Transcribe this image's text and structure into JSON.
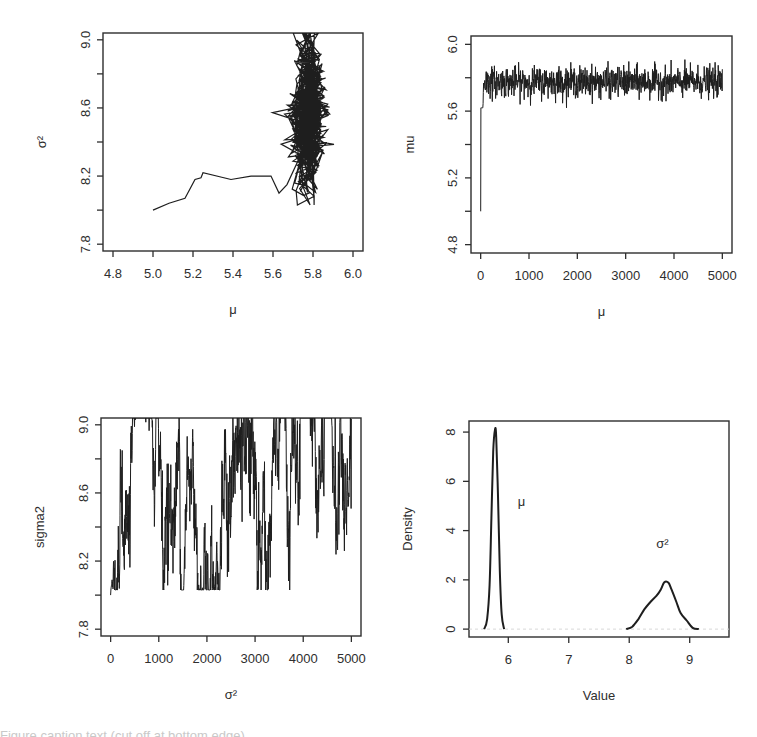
{
  "figure": {
    "width": 757,
    "height": 737,
    "line_color": "#1e1e1e",
    "axis_color": "#2e2e2e"
  },
  "chart_data": [
    {
      "id": "joint",
      "type": "line",
      "title": "",
      "xlabel": "μ",
      "ylabel": "σ²",
      "xlim": [
        4.75,
        6.05
      ],
      "ylim": [
        7.76,
        9.04
      ],
      "xticks": [
        4.8,
        5.0,
        5.2,
        5.4,
        5.6,
        5.8,
        6.0
      ],
      "xtick_labels": [
        "4.8",
        "5.0",
        "5.2",
        "5.4",
        "5.6",
        "5.8",
        "6.0"
      ],
      "yticks": [
        7.8,
        8.0,
        8.2,
        8.4,
        8.6,
        8.8,
        9.0
      ],
      "ytick_labels": [
        "7.8",
        "",
        "8.2",
        "",
        "8.6",
        "",
        "9.0"
      ],
      "burn_in_path": {
        "mu": [
          5.0,
          5.08,
          5.16,
          5.21,
          5.24,
          5.25,
          5.39,
          5.49,
          5.59,
          5.63,
          5.67
        ],
        "sigma2": [
          8.0,
          8.04,
          8.07,
          8.18,
          8.19,
          8.22,
          8.18,
          8.2,
          8.2,
          8.1,
          8.15
        ]
      },
      "cluster": {
        "mu_mean": 5.775,
        "mu_sd": 0.045,
        "sigma2_mean": 8.55,
        "sigma2_sd": 0.2,
        "n": 900
      },
      "box": {
        "x0": 103,
        "y0": 33,
        "x1": 363,
        "y1": 251
      }
    },
    {
      "id": "mu_trace",
      "type": "line",
      "title": "",
      "xlabel": "μ",
      "ylabel": "mu",
      "xlim": [
        -200,
        5200
      ],
      "ylim": [
        4.75,
        6.05
      ],
      "xticks": [
        0,
        1000,
        2000,
        3000,
        4000,
        5000
      ],
      "xtick_labels": [
        "0",
        "1000",
        "2000",
        "3000",
        "4000",
        "5000"
      ],
      "yticks": [
        4.8,
        5.0,
        5.2,
        5.4,
        5.6,
        5.8,
        6.0
      ],
      "ytick_labels": [
        "4.8",
        "",
        "5.2",
        "",
        "5.6",
        "",
        "6.0"
      ],
      "series": [
        {
          "name": "mu",
          "start": 5.0,
          "mean": 5.775,
          "sd": 0.045,
          "min": 5.62,
          "max": 5.92,
          "iterations": 5000
        }
      ],
      "box": {
        "x0": 471,
        "y0": 36,
        "x1": 732,
        "y1": 253
      }
    },
    {
      "id": "sigma2_trace",
      "type": "line",
      "title": "",
      "xlabel": "σ²",
      "ylabel": "sigma2",
      "xlim": [
        -200,
        5200
      ],
      "ylim": [
        7.76,
        9.04
      ],
      "xticks": [
        0,
        1000,
        2000,
        3000,
        4000,
        5000
      ],
      "xtick_labels": [
        "0",
        "1000",
        "2000",
        "3000",
        "4000",
        "5000"
      ],
      "yticks": [
        7.8,
        8.0,
        8.2,
        8.4,
        8.6,
        8.8,
        9.0
      ],
      "ytick_labels": [
        "7.8",
        "",
        "8.2",
        "",
        "8.6",
        "",
        "9.0"
      ],
      "series": [
        {
          "name": "sigma2",
          "start": 8.0,
          "mean": 8.55,
          "sd": 0.2,
          "min": 8.03,
          "max": 9.04,
          "iterations": 5000
        }
      ],
      "box": {
        "x0": 101,
        "y0": 418,
        "x1": 361,
        "y1": 636
      }
    },
    {
      "id": "density",
      "type": "line",
      "title": "",
      "xlabel": "Value",
      "ylabel": "Density",
      "xlim": [
        5.35,
        9.65
      ],
      "ylim": [
        -0.32,
        8.45
      ],
      "xticks": [
        6,
        7,
        8,
        9
      ],
      "xtick_labels": [
        "6",
        "7",
        "8",
        "9"
      ],
      "yticks": [
        0,
        2,
        4,
        6,
        8
      ],
      "ytick_labels": [
        "0",
        "2",
        "4",
        "6",
        "8"
      ],
      "series": [
        {
          "name": "μ",
          "x": [
            5.6,
            5.65,
            5.69,
            5.72,
            5.75,
            5.78,
            5.8,
            5.83,
            5.86,
            5.89,
            5.93
          ],
          "y": [
            0.0,
            0.4,
            1.8,
            4.5,
            7.2,
            8.1,
            7.8,
            5.4,
            2.4,
            0.6,
            0.0
          ]
        },
        {
          "name": "σ²",
          "x": [
            7.95,
            8.05,
            8.15,
            8.25,
            8.35,
            8.45,
            8.52,
            8.58,
            8.65,
            8.7,
            8.78,
            8.85,
            8.95,
            9.05,
            9.15
          ],
          "y": [
            0.0,
            0.1,
            0.4,
            0.8,
            1.1,
            1.35,
            1.6,
            1.9,
            1.88,
            1.6,
            1.1,
            0.65,
            0.35,
            0.05,
            0.0
          ]
        }
      ],
      "annotations": [
        {
          "text": "μ",
          "x": 6.22,
          "y": 5.0
        },
        {
          "text": "σ²",
          "x": 8.55,
          "y": 3.3
        }
      ],
      "zero_line": true,
      "box": {
        "x0": 469,
        "y0": 421,
        "x1": 729,
        "y1": 637
      }
    }
  ],
  "caption": "Figure caption text (cut off at bottom edge)"
}
